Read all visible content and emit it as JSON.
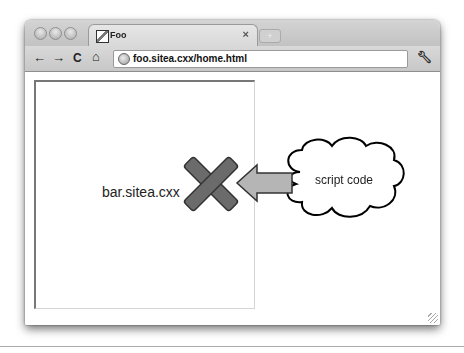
{
  "browser": {
    "tab": {
      "title": "Foo",
      "close": "×"
    },
    "new_tab": "+",
    "nav": {
      "back": "←",
      "forward": "→",
      "reload": "C",
      "home": "⌂"
    },
    "address_bar": {
      "url": "foo.sitea.cxx/home.html"
    },
    "menu_icon": "wrench-icon"
  },
  "diagram": {
    "iframe_label": "bar.sitea.cxx",
    "cloud_label": "script code",
    "blocked_icon": "x-mark",
    "arrow_direction": "left",
    "colors": {
      "x_fill": "#6b6b6b",
      "arrow_fill": "#b5b5b5",
      "outline": "#000000"
    }
  }
}
